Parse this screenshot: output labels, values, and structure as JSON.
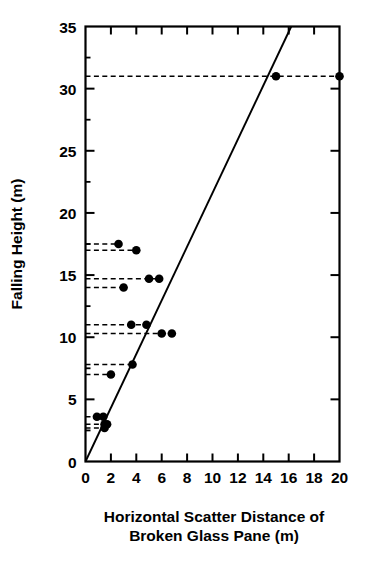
{
  "chart_data": {
    "type": "scatter",
    "title": "",
    "xlabel": "Horizontal Scatter Distance of Broken Glass Pane (m)",
    "xlabel_line1": "Horizontal Scatter Distance of",
    "xlabel_line2": "Broken Glass Pane (m)",
    "ylabel": "Falling Height (m)",
    "xlim": [
      0,
      20
    ],
    "ylim": [
      0,
      35
    ],
    "xticks": [
      0,
      2,
      4,
      6,
      8,
      10,
      12,
      14,
      16,
      18,
      20
    ],
    "xticklabels": [
      "0",
      "2",
      "4",
      "6",
      "8",
      "10",
      "12",
      "14",
      "16",
      "18",
      "20"
    ],
    "yticks": [
      0,
      5,
      10,
      15,
      20,
      25,
      30,
      35
    ],
    "yticklabels": [
      "0",
      "5",
      "10",
      "15",
      "20",
      "25",
      "30",
      "35"
    ],
    "y_minor_ticks": [
      2.5,
      7.5,
      12.5,
      17.5,
      22.5,
      27.5,
      32.5
    ],
    "grid": false,
    "legend": null,
    "marker_color": "#000000",
    "marker_shape": "filled-circle",
    "points": [
      {
        "x": 15.0,
        "y": 31.0
      },
      {
        "x": 20.0,
        "y": 31.0
      },
      {
        "x": 2.6,
        "y": 17.5
      },
      {
        "x": 4.0,
        "y": 17.0
      },
      {
        "x": 5.0,
        "y": 14.7
      },
      {
        "x": 5.8,
        "y": 14.7
      },
      {
        "x": 3.0,
        "y": 14.0
      },
      {
        "x": 3.6,
        "y": 11.0
      },
      {
        "x": 4.8,
        "y": 11.0
      },
      {
        "x": 6.0,
        "y": 10.3
      },
      {
        "x": 6.8,
        "y": 10.3
      },
      {
        "x": 3.7,
        "y": 7.8
      },
      {
        "x": 2.0,
        "y": 7.0
      },
      {
        "x": 0.9,
        "y": 3.6
      },
      {
        "x": 1.4,
        "y": 3.6
      },
      {
        "x": 1.5,
        "y": 3.0
      },
      {
        "x": 1.7,
        "y": 3.0
      },
      {
        "x": 1.5,
        "y": 2.7
      }
    ],
    "leader_lines": [
      {
        "y": 31.0,
        "x_start": 0,
        "x_end": 20.0
      },
      {
        "y": 17.5,
        "x_start": 0,
        "x_end": 2.6
      },
      {
        "y": 17.0,
        "x_start": 0,
        "x_end": 4.0
      },
      {
        "y": 14.7,
        "x_start": 0,
        "x_end": 5.8
      },
      {
        "y": 14.0,
        "x_start": 0,
        "x_end": 3.0
      },
      {
        "y": 11.0,
        "x_start": 0,
        "x_end": 4.8
      },
      {
        "y": 10.3,
        "x_start": 0,
        "x_end": 6.8
      },
      {
        "y": 7.8,
        "x_start": 0,
        "x_end": 3.7
      },
      {
        "y": 7.0,
        "x_start": 0,
        "x_end": 2.0
      },
      {
        "y": 3.6,
        "x_start": 0,
        "x_end": 1.4
      },
      {
        "y": 3.0,
        "x_start": 0,
        "x_end": 1.7
      },
      {
        "y": 2.7,
        "x_start": 0,
        "x_end": 1.5
      }
    ],
    "fit_line": {
      "x_start": 0.0,
      "y_start": 0.0,
      "x_end": 16.2,
      "y_end": 35.0
    }
  }
}
